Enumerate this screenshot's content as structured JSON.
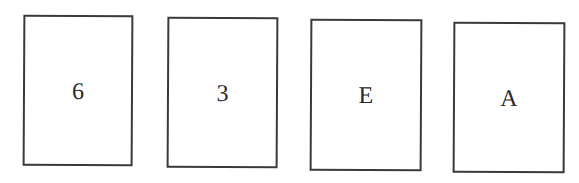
{
  "cards": [
    {
      "label": "6"
    },
    {
      "label": "3"
    },
    {
      "label": "E"
    },
    {
      "label": "A"
    }
  ],
  "colors": {
    "border": "#3a3a3a",
    "text": "#2a2a2a",
    "background": "#ffffff"
  }
}
